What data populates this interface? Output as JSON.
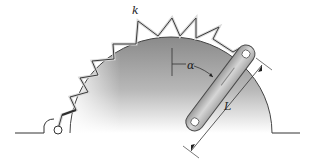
{
  "figure": {
    "labels": {
      "spring": "k",
      "angle": "α",
      "length": "L"
    },
    "colors": {
      "disk_dark": "#7a7a7a",
      "disk_light": "#f4f4f4",
      "bar_fill": "#bdbdbd",
      "bar_stroke": "#4a4a4a",
      "spring_dark": "#3a3a3a",
      "spring_light": "#d8d8d8",
      "line": "#333333"
    }
  }
}
